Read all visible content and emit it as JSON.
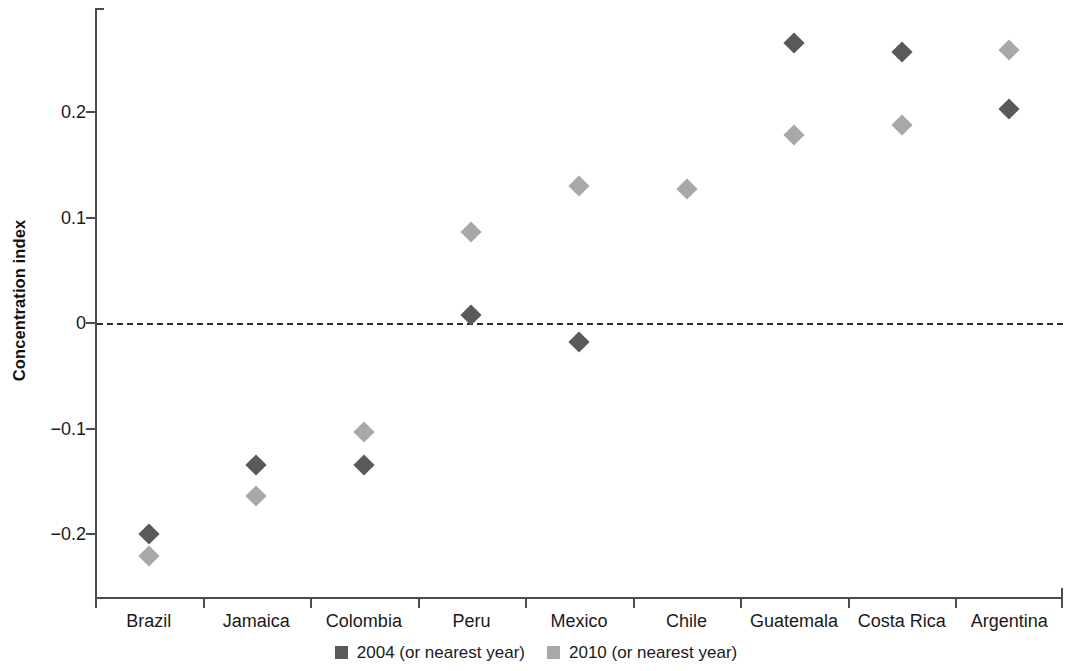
{
  "chart_data": {
    "type": "scatter",
    "title": "",
    "xlabel": "",
    "ylabel": "Concentration index",
    "ylim": [
      -0.24,
      0.28
    ],
    "yticks": [
      -0.2,
      -0.1,
      0,
      0.1,
      0.2
    ],
    "ytick_labels": [
      "−0.2",
      "−0.1",
      "0",
      "0.1",
      "0.2"
    ],
    "grid": false,
    "reference_line": 0,
    "legend_position": "bottom",
    "categories": [
      "Brazil",
      "Jamaica",
      "Colombia",
      "Peru",
      "Mexico",
      "Chile",
      "Guatemala",
      "Costa Rica",
      "Argentina"
    ],
    "series": [
      {
        "name": "2004 (or nearest year)",
        "color": "#595959",
        "values": [
          -0.2,
          -0.135,
          -0.135,
          0.008,
          -0.018,
          null,
          0.265,
          0.257,
          0.203
        ]
      },
      {
        "name": "2010 (or nearest year)",
        "color": "#a8a8a8",
        "values": [
          -0.221,
          -0.164,
          -0.103,
          0.086,
          0.13,
          0.127,
          0.178,
          0.188,
          0.259
        ]
      }
    ]
  },
  "legend": {
    "items": [
      {
        "label": "2004 (or nearest year)",
        "color": "#595959"
      },
      {
        "label": "2010 (or nearest year)",
        "color": "#a8a8a8"
      }
    ]
  },
  "axis": {
    "y_title": "Concentration index"
  }
}
